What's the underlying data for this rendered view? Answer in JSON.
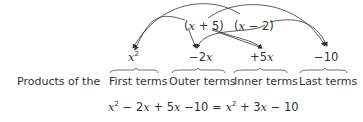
{
  "factors": [
    "(x + 5)",
    "(x − 2)"
  ],
  "products": {
    "first": "x²",
    "outer": "−2x",
    "inner": "+5x",
    "last": "−10"
  },
  "labels": {
    "prefix": "Products of the",
    "first": "First terms",
    "outer": "Outer terms",
    "inner": "Inner terms",
    "last": "Last terms"
  },
  "equation": "x² − 2x + 5x − 10 = x² + 3x − 10"
}
